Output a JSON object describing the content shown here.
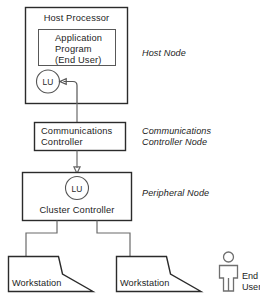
{
  "diagram": {
    "colors": {
      "background": "#ffffff",
      "box_stroke": "#2b2b2b",
      "inner_stroke": "#585858",
      "link_stroke": "#6a6a6a",
      "text": "#1d1d1d"
    },
    "host_node": {
      "box_label": "Host Processor",
      "inner_box": {
        "line1": "Application",
        "line2": "Program",
        "line3": "(End User)"
      },
      "lu_label": "LU",
      "node_label": "Host Node"
    },
    "comm_node": {
      "box_label_line1": "Communications",
      "box_label_line2": "Controller",
      "node_label_line1": "Communications",
      "node_label_line2": "Controller Node"
    },
    "peripheral_node": {
      "lu_label": "LU",
      "box_label": "Cluster Controller",
      "node_label": "Peripheral Node"
    },
    "workstations": [
      {
        "label": "Workstation"
      },
      {
        "label": "Workstation"
      }
    ],
    "end_user": {
      "icon": "person-icon",
      "label_line1": "End",
      "label_line2": "User"
    }
  }
}
